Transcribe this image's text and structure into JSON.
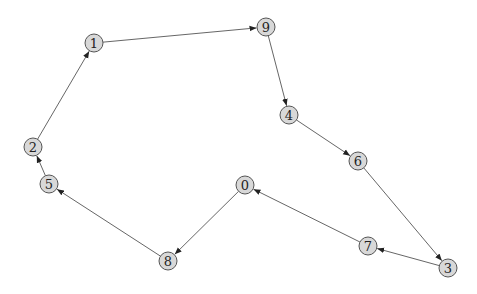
{
  "graph": {
    "type": "directed",
    "node_radius": 9,
    "colors": {
      "node_fill": "#d8d8d8",
      "node_stroke": "#555555",
      "edge": "#555555",
      "background": "#ffffff"
    },
    "nodes": [
      {
        "id": "0",
        "label": "0",
        "x": 245,
        "y": 185
      },
      {
        "id": "1",
        "label": "1",
        "x": 94,
        "y": 43
      },
      {
        "id": "2",
        "label": "2",
        "x": 33,
        "y": 147
      },
      {
        "id": "3",
        "label": "3",
        "x": 448,
        "y": 268
      },
      {
        "id": "4",
        "label": "4",
        "x": 289,
        "y": 115
      },
      {
        "id": "5",
        "label": "5",
        "x": 49,
        "y": 184
      },
      {
        "id": "6",
        "label": "6",
        "x": 358,
        "y": 161
      },
      {
        "id": "7",
        "label": "7",
        "x": 368,
        "y": 246
      },
      {
        "id": "8",
        "label": "8",
        "x": 168,
        "y": 261
      },
      {
        "id": "9",
        "label": "9",
        "x": 266,
        "y": 27
      }
    ],
    "edges": [
      {
        "from": "1",
        "to": "9"
      },
      {
        "from": "9",
        "to": "4"
      },
      {
        "from": "4",
        "to": "6"
      },
      {
        "from": "6",
        "to": "3"
      },
      {
        "from": "3",
        "to": "7"
      },
      {
        "from": "7",
        "to": "0"
      },
      {
        "from": "0",
        "to": "8"
      },
      {
        "from": "8",
        "to": "5"
      },
      {
        "from": "5",
        "to": "2"
      },
      {
        "from": "2",
        "to": "1"
      }
    ]
  }
}
